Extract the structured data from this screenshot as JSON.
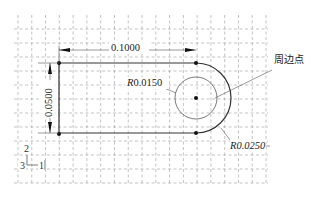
{
  "figure": {
    "type": "sketch-drawing",
    "grid": {
      "x_start": 18,
      "x_end": 266,
      "x_step": 13.78,
      "y_start": 15,
      "y_end": 183,
      "y_step": 14,
      "style": "dashed",
      "color": "#9a9a9a"
    },
    "geometry": {
      "top_line": {
        "x1": 59,
        "x2": 196,
        "y": 63
      },
      "bottom_line": {
        "x1": 59,
        "x2": 196,
        "y": 133
      },
      "left_line": {
        "x": 59,
        "y1": 63,
        "y2": 133
      },
      "arc_center": {
        "x": 196,
        "y": 98
      },
      "outer_radius_px": 35,
      "inner_radius_px": 21,
      "stroke_color": "#333333"
    },
    "dimensions": {
      "horizontal": {
        "label": "0.1000"
      },
      "vertical": {
        "label": "0.0500"
      },
      "inner_radius": {
        "prefix": "R",
        "value": "0.0150"
      },
      "outer_radius": {
        "prefix": "R",
        "value": "0.0250"
      }
    },
    "annotations": {
      "perimeter_point": "周边点"
    },
    "axis_triad": {
      "up": "2",
      "right": "1",
      "out": "3"
    }
  }
}
